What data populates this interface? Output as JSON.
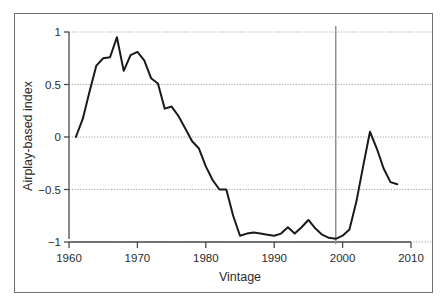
{
  "chart_data": {
    "type": "line",
    "title": "",
    "xlabel": "Vintage",
    "ylabel": "Airplay-based index",
    "xlim": [
      1960,
      2010
    ],
    "ylim": [
      -1,
      1
    ],
    "grid": true,
    "legend": null,
    "x_ticks": [
      "1960",
      "1970",
      "1980",
      "1990",
      "2000",
      "2010"
    ],
    "x_tick_values": [
      1960,
      1970,
      1980,
      1990,
      2000,
      2010
    ],
    "y_ticks": [
      "1",
      "0.5",
      "0",
      "−0.5",
      "−1"
    ],
    "y_tick_values": [
      1,
      0.5,
      0,
      -0.5,
      -1
    ],
    "annotations": [
      {
        "name": "vertical-reference-line",
        "type": "vline",
        "x": 1999,
        "color": "#8a8a8a",
        "label": ""
      }
    ],
    "series": [
      {
        "name": "Airplay-based index",
        "color": "#1a1a1a",
        "x": [
          1961,
          1962,
          1963,
          1964,
          1965,
          1966,
          1967,
          1968,
          1969,
          1970,
          1971,
          1972,
          1973,
          1974,
          1975,
          1976,
          1977,
          1978,
          1979,
          1980,
          1981,
          1982,
          1983,
          1984,
          1985,
          1986,
          1987,
          1988,
          1989,
          1990,
          1991,
          1992,
          1993,
          1994,
          1995,
          1996,
          1997,
          1998,
          1999,
          2000,
          2001,
          2002,
          2003,
          2004,
          2005,
          2006,
          2007,
          2008
        ],
        "values": [
          0.0,
          0.17,
          0.43,
          0.68,
          0.75,
          0.76,
          0.95,
          0.63,
          0.78,
          0.81,
          0.73,
          0.56,
          0.51,
          0.27,
          0.29,
          0.2,
          0.08,
          -0.04,
          -0.11,
          -0.28,
          -0.41,
          -0.5,
          -0.5,
          -0.75,
          -0.94,
          -0.92,
          -0.91,
          -0.92,
          -0.93,
          -0.94,
          -0.92,
          -0.86,
          -0.92,
          -0.86,
          -0.79,
          -0.87,
          -0.93,
          -0.96,
          -0.97,
          -0.94,
          -0.88,
          -0.62,
          -0.28,
          0.05,
          -0.11,
          -0.3,
          -0.43,
          -0.45
        ]
      }
    ]
  },
  "axis_labels": {
    "x_title": "Vintage",
    "y_title": "Airplay-based index"
  },
  "colors": {
    "line": "#1a1a1a",
    "grid": "#9a9a9a",
    "axis": "#4a4a4a",
    "frame": "#6f6f6f",
    "vline": "#8a8a8a",
    "background": "#ffffff",
    "text": "#2b2b2b"
  }
}
